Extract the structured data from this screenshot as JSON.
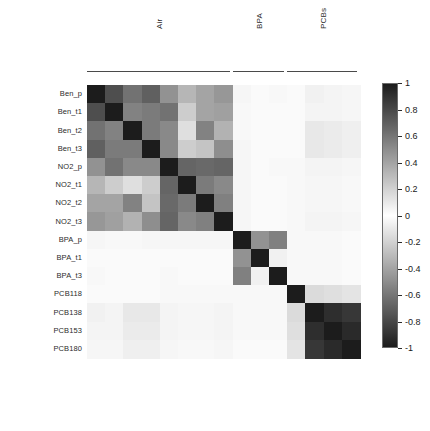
{
  "chart_data": {
    "type": "heatmap",
    "title": "",
    "xlabel": "",
    "ylabel": "",
    "colormap": "grayscale-diverging",
    "zlim": [
      -1,
      1
    ],
    "grid": false,
    "legend_position": "right",
    "colorbar": {
      "min": -1,
      "max": 1,
      "ticks": [
        1,
        0.8,
        0.6,
        0.4,
        0.2,
        0,
        -0.2,
        -0.4,
        -0.6,
        -0.8,
        -1
      ],
      "tick_labels": [
        "1",
        "0.8",
        "0.6",
        "0.4",
        "0.2",
        "0",
        "-0.2",
        "-0.4",
        "-0.6",
        "-0.8",
        "-1"
      ]
    },
    "groups": [
      {
        "label": "Air",
        "span": 8
      },
      {
        "label": "BPA",
        "span": 3
      },
      {
        "label": "PCBs",
        "span": 4
      }
    ],
    "categories": [
      "Ben_p",
      "Ben_t1",
      "Ben_t2",
      "Ben_t3",
      "NO2_p",
      "NO2_t1",
      "NO2_t2",
      "NO2_t3",
      "BPA_p",
      "BPA_t1",
      "BPA_t3",
      "PCB118",
      "PCB138",
      "PCB153",
      "PCB180"
    ],
    "row_labels": [
      "Ben_p",
      "Ben_t1",
      "Ben_t2",
      "Ben_t3",
      "NO2_p",
      "NO2_t1",
      "NO2_t2",
      "NO2_t3",
      "BPA_p",
      "BPA_t1",
      "BPA_t3",
      "PCB118",
      "PCB138",
      "PCB153",
      "PCB180"
    ],
    "column_labels": [
      "Ben_p",
      "Ben_t1",
      "Ben_t2",
      "Ben_t3",
      "NO2_p",
      "NO2_t1",
      "NO2_t2",
      "NO2_t3",
      "BPA_p",
      "BPA_t1",
      "BPA_t3",
      "PCB118",
      "PCB138",
      "PCB153",
      "PCB180"
    ],
    "values": [
      [
        1.0,
        0.78,
        0.62,
        0.7,
        0.48,
        0.32,
        0.4,
        0.46,
        0.04,
        0.02,
        0.03,
        0.02,
        0.06,
        0.05,
        0.04
      ],
      [
        0.78,
        1.0,
        0.55,
        0.58,
        0.62,
        0.22,
        0.4,
        0.42,
        0.03,
        0.02,
        0.02,
        0.02,
        0.05,
        0.05,
        0.04
      ],
      [
        0.62,
        0.55,
        1.0,
        0.58,
        0.52,
        0.14,
        0.55,
        0.34,
        0.03,
        0.02,
        0.02,
        0.02,
        0.1,
        0.09,
        0.07
      ],
      [
        0.7,
        0.58,
        0.58,
        1.0,
        0.52,
        0.22,
        0.26,
        0.5,
        0.04,
        0.02,
        0.02,
        0.02,
        0.1,
        0.09,
        0.07
      ],
      [
        0.48,
        0.62,
        0.52,
        0.52,
        1.0,
        0.68,
        0.66,
        0.68,
        0.04,
        0.02,
        0.03,
        0.03,
        0.05,
        0.05,
        0.04
      ],
      [
        0.32,
        0.22,
        0.14,
        0.22,
        0.68,
        1.0,
        0.58,
        0.52,
        0.04,
        0.02,
        0.02,
        0.03,
        0.04,
        0.04,
        0.03
      ],
      [
        0.4,
        0.4,
        0.55,
        0.26,
        0.66,
        0.58,
        1.0,
        0.56,
        0.04,
        0.02,
        0.02,
        0.03,
        0.04,
        0.04,
        0.03
      ],
      [
        0.46,
        0.42,
        0.34,
        0.5,
        0.68,
        0.52,
        0.56,
        1.0,
        0.04,
        0.02,
        0.02,
        0.03,
        0.05,
        0.05,
        0.04
      ],
      [
        0.04,
        0.03,
        0.03,
        0.04,
        0.04,
        0.04,
        0.04,
        0.04,
        1.0,
        0.48,
        0.56,
        0.03,
        0.03,
        0.03,
        0.02
      ],
      [
        0.02,
        0.02,
        0.02,
        0.02,
        0.02,
        0.02,
        0.02,
        0.02,
        0.48,
        1.0,
        0.06,
        0.03,
        0.03,
        0.03,
        0.02
      ],
      [
        0.03,
        0.02,
        0.02,
        0.02,
        0.03,
        0.02,
        0.02,
        0.02,
        0.56,
        0.06,
        1.0,
        0.03,
        0.03,
        0.03,
        0.02
      ],
      [
        0.02,
        0.02,
        0.02,
        0.02,
        0.03,
        0.03,
        0.03,
        0.03,
        0.03,
        0.03,
        0.03,
        1.0,
        0.16,
        0.14,
        0.12
      ],
      [
        0.06,
        0.05,
        0.1,
        0.1,
        0.05,
        0.04,
        0.04,
        0.05,
        0.03,
        0.03,
        0.03,
        0.16,
        1.0,
        0.92,
        0.88
      ],
      [
        0.05,
        0.05,
        0.09,
        0.09,
        0.05,
        0.04,
        0.04,
        0.05,
        0.03,
        0.03,
        0.03,
        0.14,
        0.92,
        1.0,
        0.94
      ],
      [
        0.04,
        0.04,
        0.07,
        0.07,
        0.04,
        0.03,
        0.03,
        0.04,
        0.02,
        0.02,
        0.02,
        0.12,
        0.88,
        0.94,
        1.0
      ]
    ]
  },
  "layout": {
    "matrix_left": 87,
    "matrix_top": 85,
    "cell_size": 18.2,
    "colorbar_left": 382,
    "colorbar_top": 83,
    "colorbar_width": 16,
    "colorbar_height": 265,
    "group_rule_top": 71
  }
}
